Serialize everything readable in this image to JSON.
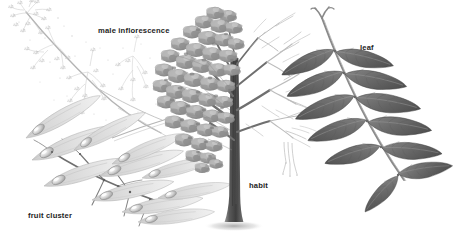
{
  "plate": {
    "kind": "botanical-illustration-plate",
    "background_color": "#ffffff",
    "width": 457,
    "height": 234,
    "rendering": "grayscale pencil / graphite shading",
    "panel_count": 4
  },
  "labels": {
    "male_inflorescence": "male inflorescence",
    "fruit_cluster": "fruit cluster",
    "habit": "habit",
    "leaf": "leaf"
  },
  "panels": [
    {
      "id": "male-inflorescence",
      "label": "male inflorescence",
      "position": "upper-left",
      "tone": "very pale light gray",
      "description": "finely branched drooping panicle of tiny staminate flowers on a slender arching stalk"
    },
    {
      "id": "fruit-cluster",
      "label": "fruit cluster",
      "position": "lower-left",
      "tone": "pale gray with darker stem",
      "description": "cluster of elongated winged samaras, each with an oval seed body near the base of a long narrow wing"
    },
    {
      "id": "habit",
      "label": "habit",
      "position": "center",
      "tone": "mid gray crown, dark trunk",
      "description": "whole tree silhouette, left half with dense foliage clumps and right half showing bare branching structure, straight central trunk with flared base and ground shadow"
    },
    {
      "id": "leaf",
      "label": "leaf",
      "position": "right",
      "tone": "dark gray",
      "description": "pinnately compound leaf with a diagonal rachis bearing about eleven lance-ovate leaflets in opposite pairs plus a terminal leaflet"
    }
  ],
  "colors": {
    "background": "#ffffff",
    "label_text": "#1d1d1d",
    "inflorescence_stroke": "#c9c9c9",
    "fruit_wing_fill": "#d9d9d9",
    "fruit_stem": "#6f6f6f",
    "crown_foliage": "#9a9a9a",
    "bare_branch": "#bdbdbd",
    "trunk": "#4a4a4a",
    "leaflet_fill": "#707070",
    "leaflet_dark": "#5a5a5a",
    "rachis": "#8a8a8a"
  },
  "leaf_panel": {
    "leaflet_count": 11,
    "arrangement": "opposite pairs with terminal leaflet",
    "rachis_direction": "upper-left to lower-right"
  },
  "fruit_panel": {
    "samara_count": 9
  }
}
